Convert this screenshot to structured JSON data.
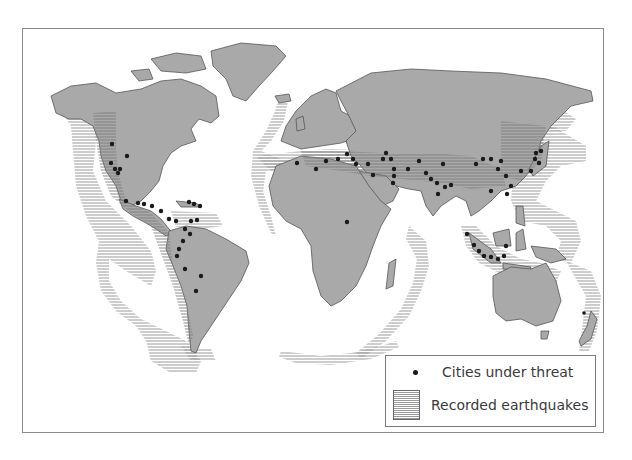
{
  "map": {
    "title": "",
    "land_color": "#a9a9a9",
    "border_color": "#555555",
    "hatch_color": "#9a9a9a",
    "city_color": "#1a1a1a",
    "background": "#ffffff"
  },
  "legend": {
    "items": [
      {
        "symbol": "dot",
        "label": "Cities under threat"
      },
      {
        "symbol": "hatch",
        "label": "Recorded earthquakes"
      }
    ]
  },
  "regions": {
    "earthquake_zones": [
      "Pacific Ring of Fire (Americas west coast)",
      "Caribbean",
      "Mid-Atlantic Ridge",
      "Alpine-Himalayan belt",
      "Indian Ocean ridge",
      "East Asia / Japan",
      "Indonesia",
      "Southwest Pacific / New Zealand",
      "Southern Ocean ridge"
    ],
    "city_clusters": [
      "US West Coast",
      "Mexico",
      "Central America",
      "Caribbean",
      "Andes",
      "Mediterranean",
      "Middle East",
      "Iran",
      "Himalaya / North India",
      "China",
      "Japan",
      "Indonesia",
      "East Africa"
    ]
  }
}
